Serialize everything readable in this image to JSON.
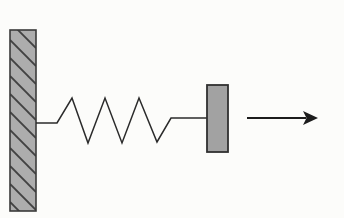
{
  "figure": {
    "kind": "physics-diagram",
    "canvas": {
      "width": 344,
      "height": 218,
      "background": "#fcfcfa"
    },
    "colors": {
      "line": "#2b2b2b",
      "arrow": "#1c1c1c",
      "wall_fill": "#adadad",
      "wall_border": "#3a3a3a",
      "wall_hatch": "#424242",
      "block_fill": "#a2a2a2",
      "block_border": "#303030"
    },
    "wall": {
      "x": 10,
      "y": 30,
      "width": 26,
      "height": 181,
      "hatch_spacing": 18,
      "hatch_width": 1.8,
      "border_width": 1.6
    },
    "spring": {
      "points": [
        [
          36,
          123
        ],
        [
          57,
          123
        ],
        [
          72,
          98
        ],
        [
          88,
          143
        ],
        [
          105,
          98
        ],
        [
          122,
          143
        ],
        [
          139,
          98
        ],
        [
          157,
          142
        ],
        [
          171,
          118
        ],
        [
          207,
          118
        ]
      ],
      "stroke_width": 1.5
    },
    "block": {
      "x": 207,
      "y": 85,
      "width": 21,
      "height": 67,
      "border_width": 1.8
    },
    "arrow": {
      "shaft_x1": 247,
      "shaft_x2": 306,
      "y": 118,
      "tip_x": 318,
      "back_x": 303,
      "notch_x": 306.5,
      "half_height": 7,
      "shaft_width": 2.2
    }
  }
}
